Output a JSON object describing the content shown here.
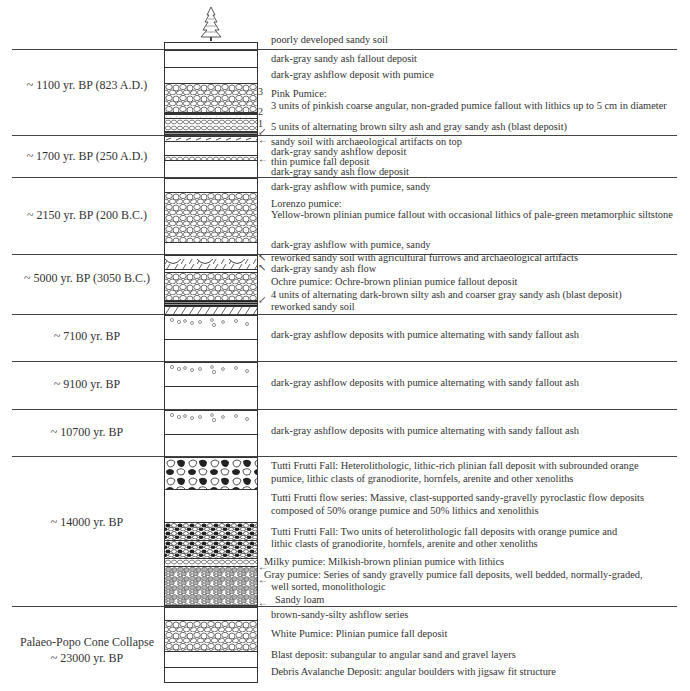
{
  "diagram": {
    "type": "stratigraphic-column",
    "tree_icon": "pine-tree-icon",
    "top_soil": "poorly developed sandy soil",
    "sections": [
      {
        "age": "~ 1100 yr. BP (823 A.D.)",
        "descriptions": [
          "dark-gray sandy ash fallout deposit",
          "dark-gray ashflow deposit with pumice",
          "Pink Pumice:",
          "3 units of pinkish coarse angular, non-graded pumice fallout with lithics up to 5 cm in diameter",
          "5 units of alternating brown silty ash and gray sandy ash (blast deposit)"
        ],
        "unit_markers": [
          "3",
          "2",
          "1"
        ]
      },
      {
        "age": "~ 1700 yr. BP (250 A.D.)",
        "descriptions": [
          "sandy soil with archaeological artifacts on top",
          "dark-gray sandy ashflow deposit",
          "thin pumice fall deposit",
          "dark-gray sandy ash flow deposit"
        ]
      },
      {
        "age": "~ 2150 yr. BP (200 B.C.)",
        "descriptions": [
          "dark-gray ashflow with pumice, sandy",
          "Lorenzo pumice:",
          "Yellow-brown plinian pumice fallout with occasional lithics of pale-green metamorphic siltstone",
          "dark-gray ashflow with pumice, sandy"
        ]
      },
      {
        "age": "~ 5000 yr. BP (3050 B.C.)",
        "descriptions": [
          "reworked sandy soil with agricultural furrows and archaeological artifacts",
          "dark-gray  sandy ash flow",
          "Ochre pumice: Ochre-brown plinian pumice fallout deposit",
          "4 units of alternating dark-brown silty ash and coarser gray sandy ash (blast deposit)",
          "reworked sandy soil"
        ]
      },
      {
        "age": "~ 7100 yr. BP",
        "descriptions": [
          "dark-gray  ashflow deposits with pumice alternating with sandy fallout ash"
        ]
      },
      {
        "age": "~ 9100 yr. BP",
        "descriptions": [
          "dark-gray  ashflow deposits with pumice alternating with sandy fallout ash"
        ]
      },
      {
        "age": "~ 10700 yr. BP",
        "descriptions": [
          "dark-gray  ashflow deposits with pumice alternating with sandy fallout ash"
        ]
      },
      {
        "age": "~ 14000 yr. BP",
        "descriptions": [
          "Tutti Frutti Fall: Heterolithologic, lithic-rich plinian fall deposit with subrounded orange",
          "pumice,  lithic clasts of granodiorite, hornfels, arenite and other xenoliths",
          "Tutti Frutti flow series: Massive, clast-supported sandy-gravelly pyroclastic flow deposits",
          "composed of 50% orange pumice and 50% lithics and xenolithis",
          "Tutti Frutti Fall: Two units of  heterolithologic fall deposits  with orange pumice and",
          "lithic clasts of granodiorite, hornfels, arenite and other xenoliths",
          "Milky pumice: Milkish-brown plinian pumice with lithics",
          "Gray  pumice: Series of sandy gravelly pumice fall deposits, well bedded, normally-graded,",
          "well sorted, monolithologic",
          "Sandy loam"
        ]
      },
      {
        "age_line1": "Palaeo-Popo Cone Collapse",
        "age_line2": "~ 23000 yr. BP",
        "descriptions": [
          "brown-sandy-silty ashflow series",
          "White Pumice: Plinian pumice fall deposit",
          "Blast deposit: subangular to angular sand and gravel layers",
          "Debris Avalanche Deposit: angular boulders with jigsaw fit structure"
        ]
      }
    ],
    "colors": {
      "line": "#444444",
      "text": "#333333",
      "gray_pumice": "#aaaaaa",
      "dark_lithic": "#222222"
    }
  }
}
